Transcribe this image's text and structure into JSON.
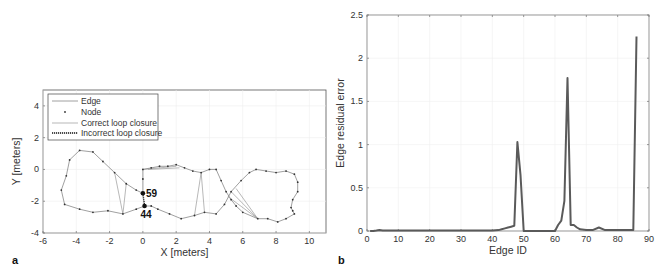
{
  "chart_data": [
    {
      "panel": "a",
      "type": "line",
      "title": "",
      "xlabel": "X [meters]",
      "ylabel": "Y [meters]",
      "xlim": [
        -6,
        11
      ],
      "ylim": [
        -4,
        5
      ],
      "xticks": [
        -6,
        -4,
        -2,
        0,
        2,
        4,
        6,
        8,
        10
      ],
      "yticks": [
        -4,
        -2,
        0,
        2,
        4
      ],
      "grid": true,
      "legend": {
        "position": "upper-left",
        "entries": [
          "Edge",
          "Node",
          "Correct loop closure",
          "Incorrect loop closure"
        ]
      },
      "trajectory": [
        [
          0.0,
          -1.5
        ],
        [
          0.0,
          -0.6
        ],
        [
          0.0,
          0.0
        ],
        [
          0.5,
          0.1
        ],
        [
          1.0,
          0.2
        ],
        [
          1.5,
          0.2
        ],
        [
          2.0,
          0.3
        ],
        [
          2.5,
          0.1
        ],
        [
          3.0,
          -0.1
        ],
        [
          3.5,
          -0.2
        ],
        [
          4.0,
          0.0
        ],
        [
          4.4,
          0.0
        ],
        [
          4.7,
          -0.7
        ],
        [
          5.0,
          -1.4
        ],
        [
          5.3,
          -1.9
        ],
        [
          5.6,
          -2.3
        ],
        [
          6.0,
          -2.7
        ],
        [
          6.9,
          -3.1
        ],
        [
          7.5,
          -3.1
        ],
        [
          8.1,
          -3.3
        ],
        [
          8.6,
          -3.1
        ],
        [
          9.1,
          -2.8
        ],
        [
          9.0,
          -2.6
        ],
        [
          8.9,
          -2.4
        ],
        [
          9.0,
          -1.9
        ],
        [
          9.3,
          -1.4
        ],
        [
          9.3,
          -0.8
        ],
        [
          9.1,
          -0.3
        ],
        [
          8.6,
          -0.1
        ],
        [
          8.0,
          -0.2
        ],
        [
          7.4,
          -0.1
        ],
        [
          6.8,
          0.0
        ],
        [
          6.4,
          -0.2
        ],
        [
          5.9,
          -0.7
        ],
        [
          5.3,
          -1.4
        ],
        [
          4.9,
          -2.2
        ],
        [
          4.4,
          -2.8
        ],
        [
          3.7,
          -2.7
        ],
        [
          3.1,
          -2.9
        ],
        [
          2.3,
          -3.1
        ],
        [
          1.6,
          -2.8
        ],
        [
          0.9,
          -2.5
        ],
        [
          0.5,
          -2.3
        ],
        [
          0.1,
          -2.3
        ],
        [
          -0.4,
          -2.5
        ],
        [
          -1.2,
          -2.8
        ],
        [
          -2.1,
          -2.6
        ],
        [
          -3.0,
          -2.7
        ],
        [
          -3.8,
          -2.5
        ],
        [
          -4.7,
          -2.2
        ],
        [
          -4.9,
          -1.3
        ],
        [
          -4.6,
          -0.4
        ],
        [
          -4.4,
          0.6
        ],
        [
          -3.8,
          1.2
        ],
        [
          -3.0,
          1.1
        ],
        [
          -2.4,
          0.5
        ],
        [
          -1.7,
          -0.2
        ],
        [
          -1.0,
          -0.9
        ],
        [
          -0.4,
          -1.3
        ],
        [
          0.0,
          -1.5
        ]
      ],
      "correct_loop_closures": [
        [
          [
            -1.7,
            -0.2
          ],
          [
            -1.2,
            -2.8
          ]
        ],
        [
          [
            -1.0,
            -0.9
          ],
          [
            -1.2,
            -2.8
          ]
        ],
        [
          [
            3.5,
            -0.2
          ],
          [
            3.1,
            -2.9
          ]
        ],
        [
          [
            3.5,
            -0.2
          ],
          [
            3.7,
            -2.7
          ]
        ],
        [
          [
            5.6,
            -1.2
          ],
          [
            6.9,
            -3.1
          ]
        ],
        [
          [
            5.3,
            -1.4
          ],
          [
            6.9,
            -3.1
          ]
        ],
        [
          [
            5.1,
            -1.7
          ],
          [
            6.9,
            -3.1
          ]
        ],
        [
          [
            0.0,
            0.0
          ],
          [
            2.0,
            0.2
          ]
        ],
        [
          [
            0.3,
            0.0
          ],
          [
            2.2,
            0.1
          ]
        ]
      ],
      "incorrect_loop_closures": [
        [
          [
            0.0,
            -1.5
          ],
          [
            0.1,
            -2.3
          ]
        ]
      ],
      "annotations": [
        {
          "text": "59",
          "x": 0.0,
          "y": -1.5
        },
        {
          "text": "44",
          "x": 0.1,
          "y": -2.3
        }
      ]
    },
    {
      "panel": "b",
      "type": "line",
      "title": "",
      "xlabel": "Edge ID",
      "ylabel": "Edge residual error",
      "xlim": [
        0,
        90
      ],
      "ylim": [
        0,
        2.5
      ],
      "xticks": [
        0,
        10,
        20,
        30,
        40,
        50,
        60,
        70,
        80,
        90
      ],
      "yticks": [
        0,
        0.5,
        1,
        1.5,
        2,
        2.5
      ],
      "ytick_labels": [
        "0",
        "0.5",
        "1",
        "1.5",
        "2",
        "2.5"
      ],
      "grid": true,
      "series": [
        {
          "name": "Edge residual error",
          "x": [
            1,
            2,
            3,
            4,
            5,
            10,
            20,
            30,
            40,
            42,
            43,
            44,
            45,
            46,
            47,
            48,
            49,
            50,
            51,
            55,
            60,
            61,
            62,
            63,
            64,
            65,
            66,
            67,
            68,
            70,
            72,
            74,
            76,
            78,
            80,
            84,
            85,
            86
          ],
          "values": [
            0.0,
            0.0,
            0.005,
            0.01,
            0.005,
            0.005,
            0.005,
            0.005,
            0.005,
            0.01,
            0.02,
            0.03,
            0.04,
            0.05,
            0.06,
            1.03,
            0.65,
            0.0,
            0.0,
            0.0,
            0.0,
            0.07,
            0.12,
            0.35,
            1.77,
            0.07,
            0.07,
            0.04,
            0.02,
            0.01,
            0.01,
            0.04,
            0.01,
            0.01,
            0.01,
            0.01,
            0.01,
            2.25
          ]
        }
      ]
    }
  ],
  "labels": {
    "panel_a": "a",
    "panel_b": "b",
    "node_59": "59",
    "node_44": "44"
  },
  "colors": {
    "edge": "#888888",
    "node": "#333333",
    "residual_line": "#5a5a5a",
    "incorrect_closure": "#111111",
    "axis": "#444444"
  }
}
